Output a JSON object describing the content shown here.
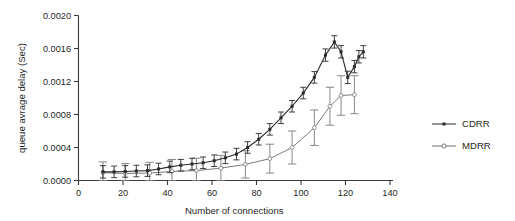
{
  "figure": {
    "width": 515,
    "height": 221,
    "background": "#ffffff"
  },
  "axes": {
    "x_title": "Number of connections",
    "y_title": "queue avrage delay (Sec)",
    "x_ticks": [
      "0",
      "20",
      "40",
      "60",
      "80",
      "100",
      "120",
      "140"
    ],
    "y_ticks": [
      "0.0000",
      "0.0004",
      "0.0008",
      "0.0012",
      "0.0016",
      "0.0020"
    ]
  },
  "legend": {
    "position": "right",
    "entries": [
      {
        "label": "CDRR",
        "color": "#2a2a2a",
        "marker": "small-filled-square"
      },
      {
        "label": "MDRR",
        "color": "#6f6f6f",
        "marker": "open-circle"
      }
    ]
  },
  "colors": {
    "cdrr": "#2a2a2a",
    "mdrr": "#7a7a7a",
    "axis": "#3a3a3a",
    "text": "#1f1f1f"
  },
  "chart_data": {
    "type": "line",
    "title": "",
    "xlabel": "Number of connections",
    "ylabel": "queue avrage delay (Sec)",
    "xlim": [
      0,
      140
    ],
    "ylim": [
      0.0,
      0.002
    ],
    "xticks": [
      0,
      20,
      40,
      60,
      80,
      100,
      120,
      140
    ],
    "yticks": [
      0.0,
      0.0004,
      0.0008,
      0.0012,
      0.0016,
      0.002
    ],
    "grid": false,
    "legend_position": "right",
    "error_bars": true,
    "series": [
      {
        "name": "CDRR",
        "marker": "small-filled-square",
        "color": "#2a2a2a",
        "x": [
          11,
          16,
          21,
          26,
          31,
          36,
          41,
          46,
          51,
          56,
          61,
          66,
          71,
          76,
          81,
          86,
          91,
          96,
          101,
          106,
          111,
          115,
          118,
          121,
          124,
          126,
          128
        ],
        "y": [
          0.000105,
          0.000105,
          0.00011,
          0.000115,
          0.00012,
          0.00014,
          0.000165,
          0.000185,
          0.0002,
          0.000215,
          0.00024,
          0.000275,
          0.00032,
          0.0004,
          0.0005,
          0.00062,
          0.00076,
          0.0009,
          0.00106,
          0.00125,
          0.00152,
          0.00168,
          0.00156,
          0.00125,
          0.00138,
          0.0015,
          0.00156
        ],
        "yerr": [
          7.5e-05,
          7e-05,
          7e-05,
          7e-05,
          7e-05,
          7e-05,
          7e-05,
          7e-05,
          7e-05,
          7e-05,
          7e-05,
          7e-05,
          7e-05,
          7e-05,
          7e-05,
          7e-05,
          7e-05,
          7e-05,
          7e-05,
          7e-05,
          7.5e-05,
          7.5e-05,
          7.5e-05,
          7.5e-05,
          7.5e-05,
          7.5e-05,
          7.5e-05
        ]
      },
      {
        "name": "MDRR",
        "marker": "open-circle",
        "color": "#7a7a7a",
        "x": [
          11,
          21,
          32,
          42,
          53,
          64,
          75,
          86,
          96,
          106,
          113,
          118,
          124
        ],
        "y": [
          9.5e-05,
          8.5e-05,
          9e-05,
          0.00011,
          0.00012,
          0.00015,
          0.000195,
          0.000265,
          0.0004,
          0.00064,
          0.0009,
          0.00103,
          0.00104
        ],
        "yerr": [
          0.00013,
          0.00012,
          0.00013,
          0.000145,
          0.00015,
          0.000155,
          0.000165,
          0.000175,
          0.0002,
          0.000215,
          0.00023,
          0.00024,
          0.00023
        ]
      }
    ]
  }
}
